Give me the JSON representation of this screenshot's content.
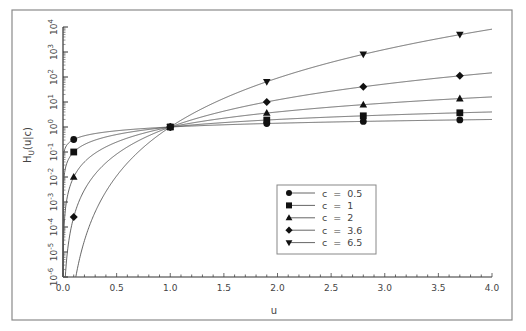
{
  "chart_data": {
    "type": "line",
    "title": "",
    "xlabel": "u",
    "ylabel": "H_U(u|c)",
    "xlim": [
      0.0,
      4.0
    ],
    "ylim": [
      1e-06,
      10000.0
    ],
    "yscale": "log",
    "grid": false,
    "legend_position": "inside lower-center-right",
    "x_ticks": [
      "0.0",
      "0.5",
      "1.0",
      "1.5",
      "2.0",
      "2.5",
      "3.0",
      "3.5",
      "4.0"
    ],
    "y_ticks": [
      "10^-6",
      "10^-5",
      "10^-4",
      "10^-3",
      "10^-2",
      "10^-1",
      "10^0",
      "10^1",
      "10^2",
      "10^3",
      "10^4"
    ],
    "marker_x": [
      0.1,
      1.0,
      1.9,
      2.8,
      3.7
    ],
    "series": [
      {
        "name": "c = 0.5",
        "c": 0.5,
        "marker": "circle",
        "values": [
          0.316,
          1.0,
          1.38,
          1.67,
          1.92
        ]
      },
      {
        "name": "c = 1",
        "c": 1,
        "marker": "square",
        "values": [
          0.1,
          1.0,
          1.9,
          2.8,
          3.7
        ]
      },
      {
        "name": "c = 2",
        "c": 2,
        "marker": "triangle-up",
        "values": [
          0.01,
          1.0,
          3.61,
          7.84,
          13.7
        ]
      },
      {
        "name": "c = 3.6",
        "c": 3.6,
        "marker": "diamond",
        "values": [
          0.00025,
          1.0,
          10.1,
          40.8,
          111
        ]
      },
      {
        "name": "c = 6.5",
        "c": 6.5,
        "marker": "triangle-down",
        "values": [
          null,
          1.0,
          65,
          807,
          4960
        ]
      }
    ],
    "curve_formula": "H = u^c"
  },
  "axes": {
    "xlabel": "u",
    "ylabel_main": "H",
    "ylabel_sub": "U",
    "ylabel_rest": "(u|c)",
    "x_tick_labels": [
      "0.0",
      "0.5",
      "1.0",
      "1.5",
      "2.0",
      "2.5",
      "3.0",
      "3.5",
      "4.0"
    ],
    "y_tick_exponents": [
      "-6",
      "-5",
      "-4",
      "-3",
      "-2",
      "-1",
      "0",
      "1",
      "2",
      "3",
      "4"
    ],
    "y_tick_base": "10"
  },
  "legend": {
    "items": [
      {
        "label": "c  =  0.5",
        "marker": "circle"
      },
      {
        "label": "c  =  1",
        "marker": "square"
      },
      {
        "label": "c  =  2",
        "marker": "triangle-up"
      },
      {
        "label": "c  =  3.6",
        "marker": "diamond"
      },
      {
        "label": "c  =  6.5",
        "marker": "triangle-down"
      }
    ]
  },
  "colors": {
    "line": "#555555",
    "marker": "#111111",
    "frame": "#888888",
    "text": "#444444"
  }
}
